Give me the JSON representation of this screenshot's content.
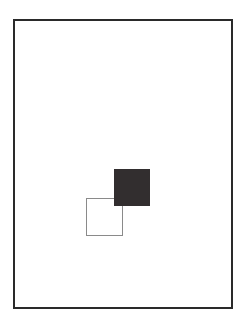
{
  "diagram": {
    "frame": {
      "shape": "rectangle",
      "style": "outline",
      "color": "#2a2a2a"
    },
    "shapes": [
      {
        "id": "filled-square",
        "shape": "square",
        "style": "filled",
        "color": "#322e2f"
      },
      {
        "id": "outline-square",
        "shape": "square",
        "style": "outline",
        "color": "#8a8a8a"
      }
    ]
  }
}
